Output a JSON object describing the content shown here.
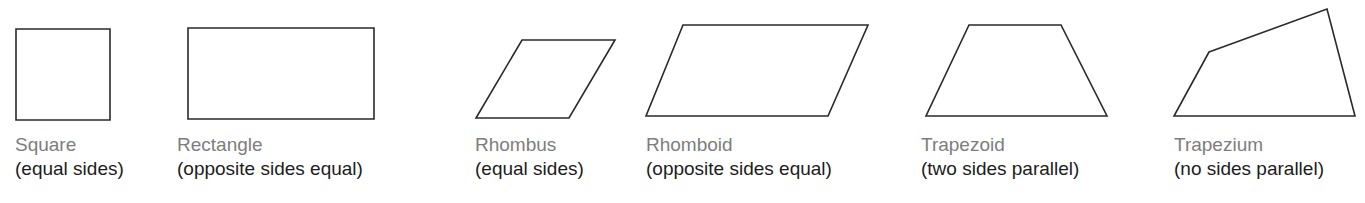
{
  "diagram": {
    "stroke_color": "#2a2a2a",
    "name_color": "#7d7d7d",
    "desc_color": "#1c1c1c",
    "shapes": [
      {
        "name": "Square",
        "description": "(equal sides)",
        "points": "16,29 110,29 110,120 16,120"
      },
      {
        "name": "Rectangle",
        "description": "(opposite sides equal)",
        "points": "188,28 374,28 374,119 188,119"
      },
      {
        "name": "Rhombus",
        "description": "(equal sides)",
        "points": "522,40 615,40 569,118 476,118"
      },
      {
        "name": "Rhomboid",
        "description": "(opposite sides equal)",
        "points": "683,25 868,25 828,116 646,116"
      },
      {
        "name": "Trapezoid",
        "description": "(two sides parallel)",
        "points": "969,25 1061,25 1107,116 926,116"
      },
      {
        "name": "Trapezium",
        "description": "(no sides parallel)",
        "points": "1209,52 1327,9 1355,116 1174,116"
      }
    ]
  }
}
